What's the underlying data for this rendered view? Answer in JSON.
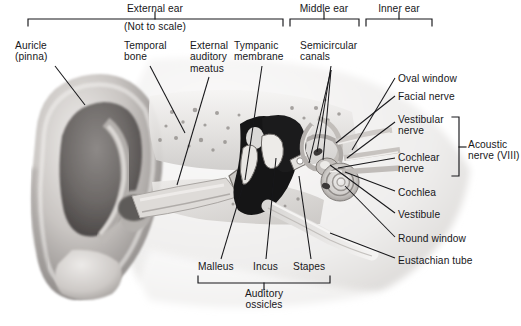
{
  "figure": {
    "note": "(Not to scale)",
    "background": "#ffffff",
    "ink": "#17171a"
  },
  "region_brackets": [
    {
      "name": "external-ear",
      "label": "External ear",
      "x1": 28,
      "x2": 283,
      "y": 19,
      "tick_x": 155,
      "label_x": 155,
      "label_y": 3
    },
    {
      "name": "middle-ear",
      "label": "Middle ear",
      "x1": 290,
      "x2": 359,
      "y": 19,
      "tick_x": 324,
      "label_x": 324,
      "label_y": 3
    },
    {
      "name": "inner-ear",
      "label": "Inner ear",
      "x1": 366,
      "x2": 432,
      "y": 19,
      "tick_x": 399,
      "label_x": 399,
      "label_y": 3
    }
  ],
  "bottom_bracket": {
    "name": "auditory-ossicles",
    "label": "Auditory\nossicles",
    "x1": 198,
    "x2": 330,
    "y": 283,
    "tick_x": 264,
    "label_x": 264,
    "label_y": 288
  },
  "side_bracket": {
    "name": "acoustic-nerve",
    "label": "Acoustic\nnerve (VIII)",
    "y1": 117,
    "y2": 176,
    "x": 459,
    "tick_y": 147,
    "label_x": 468,
    "label_y": 139
  },
  "labels": [
    {
      "id": "auricle",
      "text": "Auricle\n(pinna)",
      "x": 15,
      "y": 40,
      "align": "left",
      "leader": [
        [
          55,
          66
        ],
        [
          85,
          105
        ]
      ]
    },
    {
      "id": "temporal-bone",
      "text": "Temporal\nbone",
      "x": 124,
      "y": 40,
      "align": "left",
      "leader": [
        [
          150,
          66
        ],
        [
          185,
          133
        ]
      ]
    },
    {
      "id": "external-auditory-meatus",
      "text": "External\nauditory\nmeatus",
      "x": 190,
      "y": 40,
      "align": "left",
      "leader": [
        [
          209,
          77
        ],
        [
          177,
          185
        ]
      ]
    },
    {
      "id": "tympanic-membrane",
      "text": "Tympanic\nmembrane",
      "x": 234,
      "y": 40,
      "align": "left",
      "leader": [
        [
          262,
          66
        ],
        [
          245,
          180
        ]
      ]
    },
    {
      "id": "semicircular-canals",
      "text": "Semicircular\ncanals",
      "x": 300,
      "y": 40,
      "align": "left",
      "leader": [
        [
          331,
          66
        ],
        [
          317,
          152
        ]
      ]
    },
    {
      "id": "oval-window",
      "text": "Oval window",
      "x": 398,
      "y": 73,
      "align": "left",
      "leader": [
        [
          395,
          78
        ],
        [
          352,
          150
        ]
      ]
    },
    {
      "id": "facial-nerve",
      "text": "Facial nerve",
      "x": 398,
      "y": 91,
      "align": "left",
      "leader": [
        [
          395,
          96
        ],
        [
          336,
          143
        ]
      ]
    },
    {
      "id": "vestibular-nerve",
      "text": "Vestibular\nnerve",
      "x": 398,
      "y": 114,
      "align": "left",
      "leader": [
        [
          395,
          122
        ],
        [
          347,
          158
        ]
      ]
    },
    {
      "id": "cochlear-nerve",
      "text": "Cochlear\nnerve",
      "x": 398,
      "y": 152,
      "align": "left",
      "leader": [
        [
          395,
          158
        ],
        [
          338,
          168
        ]
      ]
    },
    {
      "id": "cochlea",
      "text": "Cochlea",
      "x": 398,
      "y": 187,
      "align": "left",
      "leader": [
        [
          395,
          191
        ],
        [
          345,
          172
        ]
      ]
    },
    {
      "id": "vestibule",
      "text": "Vestibule",
      "x": 398,
      "y": 209,
      "align": "left",
      "leader": [
        [
          395,
          213
        ],
        [
          330,
          165
        ]
      ]
    },
    {
      "id": "round-window",
      "text": "Round window",
      "x": 398,
      "y": 233,
      "align": "left",
      "leader": [
        [
          395,
          237
        ],
        [
          345,
          186
        ]
      ]
    },
    {
      "id": "eustachian-tube",
      "text": "Eustachian tube",
      "x": 398,
      "y": 255,
      "align": "left",
      "leader": [
        [
          395,
          258
        ],
        [
          330,
          233
        ]
      ]
    },
    {
      "id": "malleus",
      "text": "Malleus",
      "x": 198,
      "y": 261,
      "align": "left",
      "leader": [
        [
          221,
          259
        ],
        [
          243,
          186
        ]
      ]
    },
    {
      "id": "incus",
      "text": "Incus",
      "x": 253,
      "y": 261,
      "align": "left",
      "leader": [
        [
          266,
          259
        ],
        [
          276,
          158
        ]
      ]
    },
    {
      "id": "stapes",
      "text": "Stapes",
      "x": 293,
      "y": 261,
      "align": "left",
      "leader": [
        [
          311,
          259
        ],
        [
          299,
          176
        ]
      ]
    }
  ],
  "extra_leaders": [
    {
      "id": "semicircular-canals-b",
      "points": [
        [
          331,
          70
        ],
        [
          323,
          160
        ]
      ]
    },
    {
      "id": "semicircular-canals-c",
      "points": [
        [
          331,
          70
        ],
        [
          309,
          163
        ]
      ]
    }
  ],
  "structures": [
    {
      "name": "auricle-pinna",
      "region": "external"
    },
    {
      "name": "external-auditory-meatus",
      "region": "external"
    },
    {
      "name": "temporal-bone",
      "region": "external"
    },
    {
      "name": "tympanic-membrane",
      "region": "middle"
    },
    {
      "name": "malleus",
      "region": "middle"
    },
    {
      "name": "incus",
      "region": "middle"
    },
    {
      "name": "stapes",
      "region": "middle"
    },
    {
      "name": "eustachian-tube",
      "region": "middle"
    },
    {
      "name": "semicircular-canals",
      "region": "inner"
    },
    {
      "name": "cochlea",
      "region": "inner"
    },
    {
      "name": "vestibule",
      "region": "inner"
    },
    {
      "name": "oval-window",
      "region": "inner"
    },
    {
      "name": "round-window",
      "region": "inner"
    },
    {
      "name": "vestibular-nerve",
      "region": "inner"
    },
    {
      "name": "cochlear-nerve",
      "region": "inner"
    },
    {
      "name": "facial-nerve",
      "region": "inner"
    }
  ]
}
